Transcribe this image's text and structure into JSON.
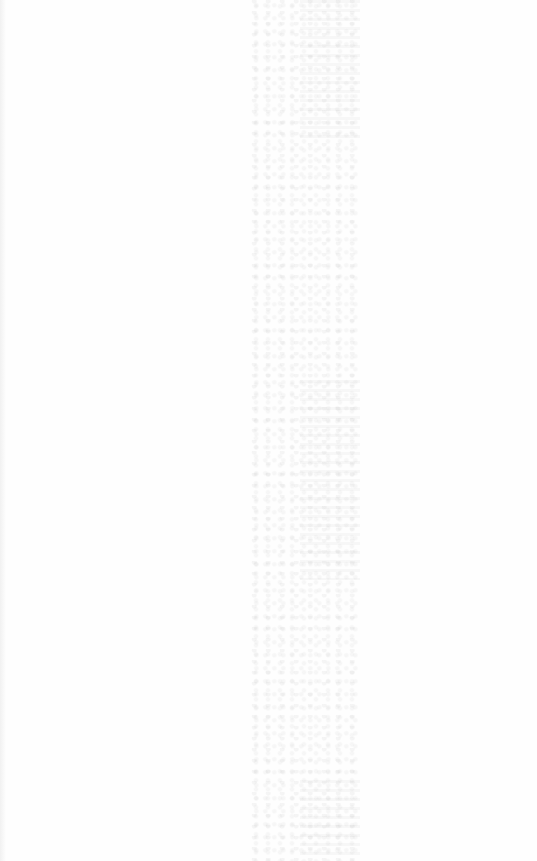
{
  "document": {
    "description": "Blank scanned page with faint bleed-through noise",
    "visible_text": ""
  },
  "colors": {
    "paper": "#fefefe",
    "noise": "#8c8c8c"
  }
}
